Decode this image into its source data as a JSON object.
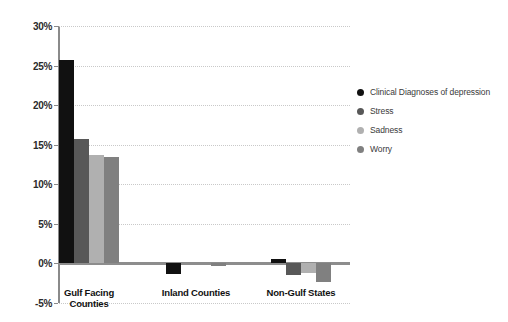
{
  "chart_data": {
    "type": "bar",
    "title": "",
    "subtitle": "",
    "xlabel": "",
    "ylabel": "",
    "categories": [
      "Gulf Facing Counties",
      "Inland Counties",
      "Non-Gulf States"
    ],
    "category_lines": [
      [
        "Gulf Facing",
        "Counties"
      ],
      [
        "Inland Counties"
      ],
      [
        "Non-Gulf States"
      ]
    ],
    "series": [
      {
        "name": "Clinical Diagnoses of depression",
        "color": "#111111",
        "values": [
          25.7,
          -1.3,
          0.5
        ]
      },
      {
        "name": "Stress",
        "color": "#585858",
        "values": [
          15.7,
          0.0,
          -1.4
        ]
      },
      {
        "name": "Sadness",
        "color": "#b0b0b0",
        "values": [
          13.7,
          0.0,
          -1.2
        ]
      },
      {
        "name": "Worry",
        "color": "#808080",
        "values": [
          13.4,
          -0.3,
          -2.3
        ]
      }
    ],
    "ylim": [
      -5,
      30
    ],
    "ytick_labels": [
      "30%",
      "25%",
      "20%",
      "15%",
      "10%",
      "5%",
      "0%",
      "-5%"
    ],
    "ytick_values": [
      30,
      25,
      20,
      15,
      10,
      5,
      0,
      -5
    ],
    "grid": true,
    "grid_axis": "y",
    "legend_position": "right",
    "zero_line": true,
    "axis_color": "#8a8a8a",
    "grid_color": "#c9c9c9",
    "background": "#ffffff"
  },
  "legend": {
    "items": [
      {
        "label": "Clinical Diagnoses of depression",
        "color": "#111111"
      },
      {
        "label": "Stress",
        "color": "#585858"
      },
      {
        "label": "Sadness",
        "color": "#b0b0b0"
      },
      {
        "label": "Worry",
        "color": "#808080"
      }
    ]
  }
}
